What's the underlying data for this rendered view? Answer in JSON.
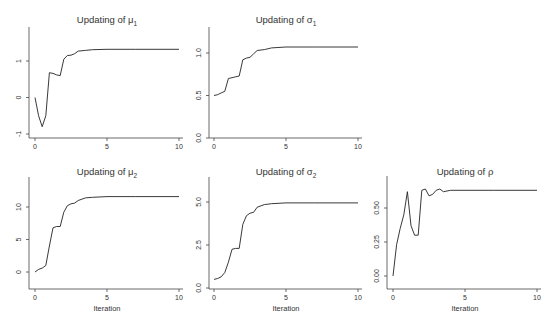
{
  "chart_data": [
    {
      "type": "line",
      "title": "Updating of μ₁",
      "title_main": "Updating of μ",
      "title_sub": "1",
      "xlabel": "",
      "ylabel": "",
      "xlim": [
        0,
        10
      ],
      "ylim": [
        -1,
        1.8
      ],
      "xticks": [
        0,
        5,
        10
      ],
      "yticks": [
        -1,
        0,
        1
      ],
      "x": [
        0,
        0.25,
        0.5,
        0.75,
        1.0,
        1.25,
        1.5,
        1.75,
        2.0,
        2.25,
        2.5,
        2.75,
        3.0,
        3.5,
        4.0,
        5.0,
        7.0,
        10.0
      ],
      "values": [
        0,
        -0.5,
        -0.8,
        -0.5,
        0.68,
        0.66,
        0.62,
        0.6,
        1.05,
        1.15,
        1.16,
        1.2,
        1.27,
        1.29,
        1.31,
        1.32,
        1.32,
        1.32
      ],
      "grid": false
    },
    {
      "type": "line",
      "title": "Updating of σ₁",
      "title_main": "Updating of σ",
      "title_sub": "1",
      "xlabel": "",
      "ylabel": "",
      "xlim": [
        0,
        10
      ],
      "ylim": [
        0,
        1.3
      ],
      "xticks": [
        0,
        5,
        10
      ],
      "yticks": [
        0.0,
        0.5,
        1.0
      ],
      "ytick_labels": [
        "0.0",
        "0.5",
        "1.0"
      ],
      "x": [
        0,
        0.25,
        0.5,
        0.75,
        1.0,
        1.25,
        1.5,
        1.75,
        2.0,
        2.25,
        2.5,
        2.75,
        3.0,
        3.5,
        4.0,
        5.0,
        7.0,
        10.0
      ],
      "values": [
        0.5,
        0.51,
        0.53,
        0.55,
        0.7,
        0.71,
        0.72,
        0.73,
        0.92,
        0.94,
        0.95,
        0.99,
        1.03,
        1.04,
        1.06,
        1.07,
        1.07,
        1.07
      ],
      "grid": false
    },
    {
      "type": "line",
      "title": "Updating of μ₂",
      "title_main": "Updating of μ",
      "title_sub": "2",
      "xlabel": "Iteration",
      "ylabel": "",
      "xlim": [
        0,
        10
      ],
      "ylim": [
        -2.5,
        14.5
      ],
      "xticks": [
        0,
        5,
        10
      ],
      "yticks": [
        0,
        5,
        10
      ],
      "x": [
        0,
        0.25,
        0.5,
        0.75,
        1.0,
        1.25,
        1.5,
        1.75,
        2.0,
        2.25,
        2.5,
        2.75,
        3.0,
        3.5,
        4.0,
        5.0,
        7.0,
        10.0
      ],
      "values": [
        0,
        0.4,
        0.6,
        1.0,
        4.0,
        6.8,
        7.0,
        7.0,
        9.2,
        10.2,
        10.5,
        10.6,
        11.0,
        11.4,
        11.5,
        11.6,
        11.6,
        11.6
      ],
      "grid": false
    },
    {
      "type": "line",
      "title": "Updating of σ₂",
      "title_main": "Updating of σ",
      "title_sub": "2",
      "xlabel": "Iteration",
      "ylabel": "",
      "xlim": [
        0,
        10
      ],
      "ylim": [
        0,
        6.3
      ],
      "xticks": [
        0,
        5,
        10
      ],
      "yticks": [
        0.0,
        2.5,
        5.0
      ],
      "ytick_labels": [
        "0.0",
        "2.5",
        "5.0"
      ],
      "x": [
        0,
        0.25,
        0.5,
        0.75,
        1.0,
        1.25,
        1.5,
        1.75,
        2.0,
        2.25,
        2.5,
        2.75,
        3.0,
        3.5,
        4.0,
        5.0,
        7.0,
        10.0
      ],
      "values": [
        0.5,
        0.55,
        0.65,
        0.9,
        1.5,
        2.25,
        2.3,
        2.3,
        3.7,
        4.2,
        4.35,
        4.4,
        4.7,
        4.85,
        4.9,
        4.95,
        4.95,
        4.95
      ],
      "grid": false
    },
    {
      "type": "line",
      "title": "Updating of ρ",
      "title_main": "Updating of ρ",
      "title_sub": "",
      "xlabel": "Iteration",
      "ylabel": "",
      "xlim": [
        0,
        10
      ],
      "ylim": [
        -0.05,
        0.7
      ],
      "xticks": [
        0,
        5,
        10
      ],
      "yticks": [
        0.0,
        0.25,
        0.5
      ],
      "ytick_labels": [
        "0.00",
        "0.25",
        "0.50"
      ],
      "x": [
        0,
        0.25,
        0.5,
        0.75,
        1.0,
        1.25,
        1.5,
        1.75,
        2.0,
        2.25,
        2.5,
        2.75,
        3.0,
        3.25,
        3.5,
        4.0,
        5.0,
        7.0,
        10.0
      ],
      "values": [
        0.0,
        0.23,
        0.35,
        0.45,
        0.62,
        0.37,
        0.3,
        0.3,
        0.63,
        0.64,
        0.59,
        0.6,
        0.63,
        0.64,
        0.62,
        0.63,
        0.63,
        0.63,
        0.63
      ],
      "grid": false
    }
  ]
}
